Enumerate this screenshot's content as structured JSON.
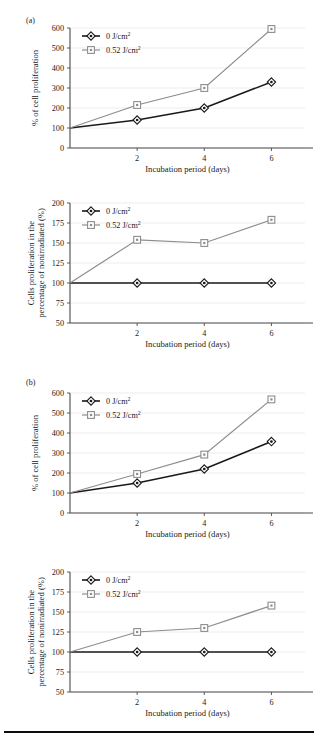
{
  "figure": {
    "panel_a_label": "(a)",
    "panel_b_label": "(b)",
    "series_colors": {
      "irradiated_0": "#1a1a1a",
      "irradiated_052": "#8d8d8d",
      "gridline": "#e8e8e8",
      "axis": "#4a4a4a"
    }
  },
  "charts": [
    {
      "id": "chart-a-top",
      "panel": "(a)",
      "chart_data": {
        "type": "line",
        "title": "",
        "xlabel": "Incubation period (days)",
        "ylabel": "% of cell proliferation",
        "x": [
          0,
          2,
          4,
          6
        ],
        "categories": [
          "0",
          "2",
          "4",
          "6"
        ],
        "xticks": [
          "2",
          "4",
          "6"
        ],
        "xlim": [
          0,
          7
        ],
        "ylim": [
          0,
          600
        ],
        "yticks": [
          "0",
          "100",
          "200",
          "300",
          "400",
          "500",
          "600"
        ],
        "grid": true,
        "legend_position": "top-left",
        "series": [
          {
            "name": "0 J/cm2",
            "label": "0 J/cm",
            "exponent": "2",
            "marker": "diamond",
            "color": "#1a1a1a",
            "values": [
              100,
              140,
              200,
              330
            ]
          },
          {
            "name": "0.52 J/cm2",
            "label": "0.52 J/cm",
            "exponent": "2",
            "marker": "square",
            "color": "#8d8d8d",
            "values": [
              100,
              215,
              300,
              595
            ]
          }
        ]
      }
    },
    {
      "id": "chart-a-bottom",
      "panel": "(a)",
      "chart_data": {
        "type": "line",
        "title": "",
        "xlabel": "Incubation period (days)",
        "ylabel": "Cells proliferation in the percentage of nonirradiated (%)",
        "ylabel_line1": "Cells proliferation in the",
        "ylabel_line2": "percentage of nonirradiated (%)",
        "x": [
          0,
          2,
          4,
          6
        ],
        "categories": [
          "0",
          "2",
          "4",
          "6"
        ],
        "xticks": [
          "2",
          "4",
          "6"
        ],
        "xlim": [
          0,
          7
        ],
        "ylim": [
          50,
          200
        ],
        "yticks": [
          "50",
          "75",
          "100",
          "125",
          "150",
          "175",
          "200"
        ],
        "grid": true,
        "legend_position": "top-left",
        "series": [
          {
            "name": "0 J/cm2",
            "label": "0 J/cm",
            "exponent": "2",
            "marker": "diamond",
            "color": "#1a1a1a",
            "values": [
              100,
              100,
              100,
              100
            ]
          },
          {
            "name": "0.52 J/cm2",
            "label": "0.52 J/cm",
            "exponent": "2",
            "marker": "square",
            "color": "#8d8d8d",
            "values": [
              100,
              154,
              150,
              179
            ]
          }
        ]
      }
    },
    {
      "id": "chart-b-top",
      "panel": "(b)",
      "chart_data": {
        "type": "line",
        "title": "",
        "xlabel": "Incubation period (days)",
        "ylabel": "% of cell proliferation",
        "x": [
          0,
          2,
          4,
          6
        ],
        "categories": [
          "0",
          "2",
          "4",
          "6"
        ],
        "xticks": [
          "2",
          "4",
          "6"
        ],
        "xlim": [
          0,
          7
        ],
        "ylim": [
          0,
          600
        ],
        "yticks": [
          "0",
          "100",
          "200",
          "300",
          "400",
          "500",
          "600"
        ],
        "grid": true,
        "legend_position": "top-left",
        "series": [
          {
            "name": "0 J/cm2",
            "label": "0 J/cm",
            "exponent": "2",
            "marker": "diamond",
            "color": "#1a1a1a",
            "values": [
              100,
              150,
              220,
              357
            ]
          },
          {
            "name": "0.52 J/cm2",
            "label": "0.52 J/cm",
            "exponent": "2",
            "marker": "square",
            "color": "#8d8d8d",
            "values": [
              100,
              195,
              292,
              568
            ]
          }
        ]
      }
    },
    {
      "id": "chart-b-bottom",
      "panel": "(b)",
      "chart_data": {
        "type": "line",
        "title": "",
        "xlabel": "Incubation period (days)",
        "ylabel": "Cells proliferation in the percentage of nonirradiated (%)",
        "ylabel_line1": "Cells proliferation in the",
        "ylabel_line2": "percentage of nonirradiated (%)",
        "x": [
          0,
          2,
          4,
          6
        ],
        "categories": [
          "0",
          "2",
          "4",
          "6"
        ],
        "xticks": [
          "2",
          "4",
          "6"
        ],
        "xlim": [
          0,
          7
        ],
        "ylim": [
          50,
          200
        ],
        "yticks": [
          "50",
          "75",
          "100",
          "125",
          "150",
          "175",
          "200"
        ],
        "grid": true,
        "legend_position": "top-left",
        "series": [
          {
            "name": "0 J/cm2",
            "label": "0 J/cm",
            "exponent": "2",
            "marker": "diamond",
            "color": "#1a1a1a",
            "values": [
              100,
              100,
              100,
              100
            ]
          },
          {
            "name": "0.52 J/cm2",
            "label": "0.52 J/cm",
            "exponent": "2",
            "marker": "square",
            "color": "#8d8d8d",
            "values": [
              100,
              125,
              130,
              158
            ]
          }
        ]
      }
    }
  ]
}
